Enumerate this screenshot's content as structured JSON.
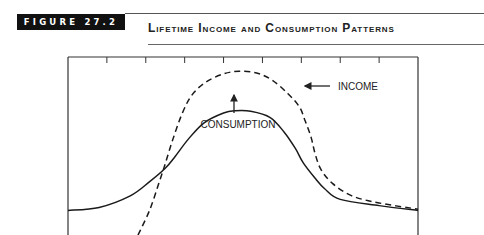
{
  "figure": {
    "label": "FIGURE 27.2",
    "title": "Lifetime Income and Consumption Patterns"
  },
  "chart_data": {
    "type": "line",
    "title": "Lifetime Income and Consumption Patterns",
    "xlabel": "",
    "ylabel": "",
    "x_ticks": 8,
    "xlim": [
      0,
      9
    ],
    "ylim": [
      0,
      10
    ],
    "grid": false,
    "legend": "none",
    "series": [
      {
        "name": "CONSUMPTION",
        "style": "solid",
        "points": [
          [
            0,
            1.38
          ],
          [
            0.8,
            1.55
          ],
          [
            1.6,
            2.2
          ],
          [
            2.1,
            3.0
          ],
          [
            2.5,
            3.75
          ],
          [
            2.75,
            4.4
          ],
          [
            3.1,
            5.4
          ],
          [
            3.5,
            6.3
          ],
          [
            4.0,
            6.85
          ],
          [
            4.3,
            6.98
          ],
          [
            4.7,
            6.95
          ],
          [
            5.2,
            6.6
          ],
          [
            5.55,
            5.8
          ],
          [
            5.85,
            4.85
          ],
          [
            6.05,
            4.05
          ],
          [
            6.35,
            3.2
          ],
          [
            6.6,
            2.6
          ],
          [
            7.0,
            2.0
          ],
          [
            8.0,
            1.65
          ],
          [
            9.0,
            1.38
          ]
        ]
      },
      {
        "name": "INCOME",
        "style": "dashed",
        "points": [
          [
            1.8,
            0.0
          ],
          [
            2.1,
            1.4
          ],
          [
            2.35,
            3.0
          ],
          [
            2.5,
            4.0
          ],
          [
            2.7,
            5.4
          ],
          [
            2.95,
            6.9
          ],
          [
            3.2,
            7.9
          ],
          [
            3.55,
            8.6
          ],
          [
            4.0,
            9.05
          ],
          [
            4.4,
            9.2
          ],
          [
            4.85,
            9.1
          ],
          [
            5.25,
            8.7
          ],
          [
            5.65,
            7.95
          ],
          [
            5.95,
            7.2
          ],
          [
            6.1,
            6.4
          ],
          [
            6.25,
            5.5
          ],
          [
            6.35,
            4.6
          ],
          [
            6.5,
            3.7
          ],
          [
            6.8,
            2.9
          ],
          [
            7.3,
            2.2
          ],
          [
            8.0,
            1.8
          ],
          [
            9.0,
            1.45
          ]
        ]
      }
    ],
    "annotations": [
      {
        "text": "INCOME",
        "arrow": "left",
        "target_series": "INCOME"
      },
      {
        "text": "CONSUMPTION",
        "arrow": "up",
        "target_series": "CONSUMPTION"
      }
    ]
  }
}
